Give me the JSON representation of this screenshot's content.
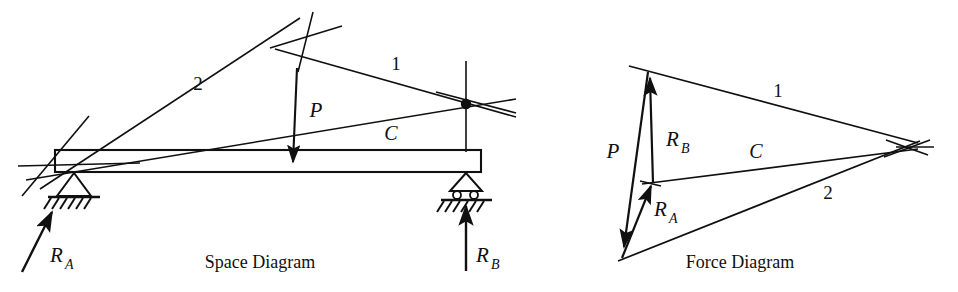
{
  "figure": {
    "background_color": "#ffffff",
    "ink_color": "#101010",
    "width": 958,
    "height": 292
  },
  "space_diagram": {
    "caption": "Space Diagram",
    "caption_pos": {
      "x": 260,
      "y": 268
    },
    "beam": {
      "x1": 55,
      "y1": 150,
      "x2": 481,
      "y2": 172,
      "label": "beam"
    },
    "supports": {
      "pin": {
        "x": 74,
        "y": 172,
        "type": "pin-hatched"
      },
      "roller": {
        "x": 466,
        "y": 172,
        "type": "roller-hatched"
      }
    },
    "load": {
      "name": "P",
      "label": "P",
      "label_pos": {
        "x": 316,
        "y": 117
      },
      "arrow": {
        "x1": 297,
        "y1": 68,
        "x2": 293,
        "y2": 163
      },
      "direction": "down"
    },
    "reactions": [
      {
        "name": "R_A",
        "label": "R",
        "subscript": "A",
        "label_pos": {
          "x": 52,
          "y": 261
        },
        "arrow": {
          "x1": 22,
          "y1": 272,
          "x2": 52,
          "y2": 213
        },
        "direction": "up-right"
      },
      {
        "name": "R_B",
        "label": "R",
        "subscript": "B",
        "label_pos": {
          "x": 476,
          "y": 262
        },
        "arrow": {
          "x1": 466,
          "y1": 272,
          "x2": 466,
          "y2": 207
        },
        "direction": "up"
      }
    ],
    "rays": [
      {
        "label": "2",
        "label_pos": {
          "x": 198,
          "y": 90
        }
      },
      {
        "label": "1",
        "label_pos": {
          "x": 396,
          "y": 70
        }
      },
      {
        "label": "C",
        "label_pos": {
          "x": 391,
          "y": 140
        }
      }
    ],
    "node": {
      "x": 466,
      "y": 104,
      "r": 5,
      "name": "ray-intersection-node"
    },
    "apex": {
      "x": 306,
      "y": 37,
      "name": "ray-apex-crossing"
    }
  },
  "force_diagram": {
    "caption": "Force Diagram",
    "caption_pos": {
      "x": 740,
      "y": 268
    },
    "pole": {
      "x": 900,
      "y": 148,
      "name": "pole-point"
    },
    "vectors": [
      {
        "name": "P",
        "label": "P",
        "label_pos": {
          "x": 615,
          "y": 157
        },
        "arrow": {
          "x1": 648,
          "y1": 72,
          "x2": 624,
          "y2": 248
        },
        "direction": "down"
      },
      {
        "name": "R_B",
        "label": "R",
        "subscript": "B",
        "label_pos": {
          "x": 672,
          "y": 146
        },
        "arrow": {
          "x1": 653,
          "y1": 182,
          "x2": 650,
          "y2": 76
        },
        "direction": "up"
      },
      {
        "name": "R_A",
        "label": "R",
        "subscript": "A",
        "label_pos": {
          "x": 660,
          "y": 215
        },
        "arrow": {
          "x1": 624,
          "y1": 258,
          "x2": 651,
          "y2": 184
        },
        "direction": "up"
      }
    ],
    "rays": [
      {
        "label": "1",
        "label_pos": {
          "x": 778,
          "y": 97
        }
      },
      {
        "label": "C",
        "label_pos": {
          "x": 756,
          "y": 157
        }
      },
      {
        "label": "2",
        "label_pos": {
          "x": 828,
          "y": 199
        }
      }
    ]
  }
}
